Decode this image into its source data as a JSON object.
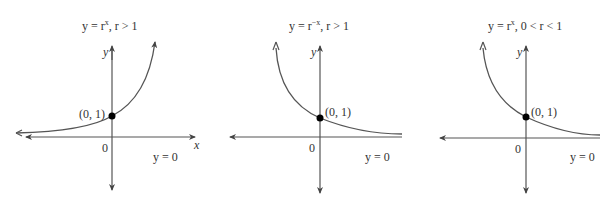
{
  "panels": [
    {
      "title": "y = rˣ, r > 1",
      "title_parts": {
        "pre": "y = r",
        "sup": "x",
        "post": ", r > 1"
      },
      "point_label": "(0, 1)",
      "origin_label": "0",
      "asymptote_label": "y = 0",
      "x_axis_label": "x",
      "y_axis_label": "y",
      "behavior": "increasing"
    },
    {
      "title": "y = r⁻ˣ, r > 1",
      "title_parts": {
        "pre": "y = r",
        "sup": "−x",
        "post": ", r > 1"
      },
      "point_label": "(0, 1)",
      "origin_label": "0",
      "asymptote_label": "y = 0",
      "x_axis_label": "x",
      "y_axis_label": "y",
      "behavior": "decreasing"
    },
    {
      "title": "y = rˣ, 0 < r < 1",
      "title_parts": {
        "pre": "y = r",
        "sup": "x",
        "post": ", 0 < r < 1"
      },
      "point_label": "(0, 1)",
      "origin_label": "0",
      "asymptote_label": "y = 0",
      "x_axis_label": "x",
      "y_axis_label": "y",
      "behavior": "decreasing"
    }
  ],
  "colors": {
    "curve": "#555555",
    "axis": "#555555",
    "point": "#000000",
    "text": "#333333"
  }
}
